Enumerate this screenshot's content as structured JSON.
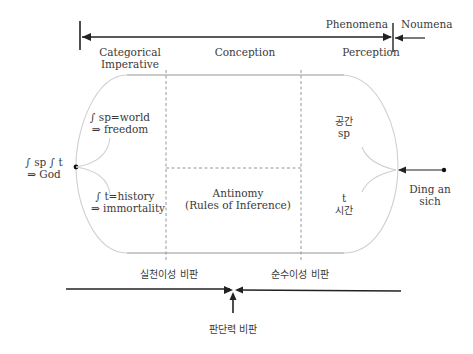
{
  "top_axis": {
    "phenomena": "Phenomena",
    "noumena": "Noumena"
  },
  "columns": {
    "categorical_1": "Categorical",
    "categorical_2": "Imperative",
    "conception": "Conception",
    "perception": "Perception"
  },
  "left": {
    "world_1": "∫ sp=world",
    "world_2": "⇒ freedom",
    "history_1": "∫ t=history",
    "history_2": "⇒ immortality",
    "god_1": "∫ sp  ∫ t",
    "god_2": "⇒ God"
  },
  "center": {
    "antinomy_1": "Antinomy",
    "antinomy_2": "(Rules of Inference)"
  },
  "right": {
    "space_kr": "공간",
    "space_sym": "sp",
    "time_sym": "t",
    "time_kr": "시간",
    "ding_1": "Ding an",
    "ding_2": "sich"
  },
  "bottom": {
    "practical": "실천이성 비판",
    "pure": "순수이성 비판",
    "judgment": "판단력 비판"
  },
  "colors": {
    "line_dark": "#222222",
    "line_light": "#c8c8c8",
    "dashed": "#8a8a8a",
    "text": "#3a3a3a"
  }
}
